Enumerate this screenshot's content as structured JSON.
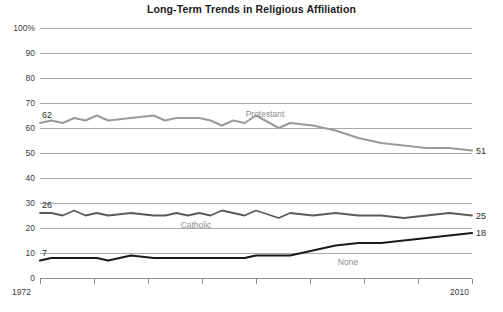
{
  "chart_data": {
    "type": "line",
    "title": "Long-Term Trends in Religious Affiliation",
    "xlabel": "",
    "ylabel": "",
    "xlim": [
      1972,
      2010
    ],
    "ylim": [
      0,
      100
    ],
    "grid": true,
    "legend_position": "inline-series-labels",
    "ytick_labels": [
      "0",
      "10",
      "20",
      "30",
      "40",
      "50",
      "60",
      "70",
      "80",
      "90",
      "100%"
    ],
    "ytick_values": [
      0,
      10,
      20,
      30,
      40,
      50,
      60,
      70,
      80,
      90,
      100
    ],
    "xtick_labels": [
      "1972",
      "2010"
    ],
    "xtick_values": [
      1972,
      2010
    ],
    "x": [
      1972,
      1973,
      1974,
      1975,
      1976,
      1977,
      1978,
      1980,
      1982,
      1983,
      1984,
      1985,
      1986,
      1987,
      1988,
      1989,
      1990,
      1991,
      1993,
      1994,
      1996,
      1998,
      2000,
      2002,
      2004,
      2006,
      2008,
      2010
    ],
    "series": [
      {
        "name": "Protestant",
        "color": "#9a9a9a",
        "start_value": 62,
        "end_value": 51,
        "values": [
          62,
          63,
          62,
          64,
          63,
          65,
          63,
          64,
          65,
          63,
          64,
          64,
          64,
          63,
          61,
          63,
          62,
          65,
          60,
          62,
          61,
          59,
          56,
          54,
          53,
          52,
          52,
          51
        ]
      },
      {
        "name": "Catholic",
        "color": "#5a5a5a",
        "start_value": 26,
        "end_value": 25,
        "values": [
          26,
          26,
          25,
          27,
          25,
          26,
          25,
          26,
          25,
          25,
          26,
          25,
          26,
          25,
          27,
          26,
          25,
          27,
          24,
          26,
          25,
          26,
          25,
          25,
          24,
          25,
          26,
          25
        ]
      },
      {
        "name": "None",
        "color": "#1a1a1a",
        "start_value": 7,
        "end_value": 18,
        "values": [
          7,
          8,
          8,
          8,
          8,
          8,
          7,
          9,
          8,
          8,
          8,
          8,
          8,
          8,
          8,
          8,
          8,
          9,
          9,
          9,
          11,
          13,
          14,
          14,
          15,
          16,
          17,
          18
        ]
      }
    ],
    "annotations": [
      {
        "text": "62",
        "series": "Protestant",
        "position": "start"
      },
      {
        "text": "51",
        "series": "Protestant",
        "position": "end"
      },
      {
        "text": "26",
        "series": "Catholic",
        "position": "start"
      },
      {
        "text": "25",
        "series": "Catholic",
        "position": "end"
      },
      {
        "text": "7",
        "series": "None",
        "position": "start"
      },
      {
        "text": "18",
        "series": "None",
        "position": "end"
      }
    ]
  }
}
